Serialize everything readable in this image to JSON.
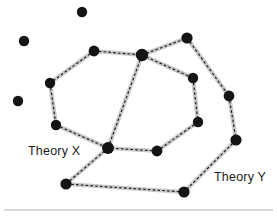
{
  "figure": {
    "background_color": "#ffffff",
    "width": 277,
    "height": 216
  },
  "labels": [
    {
      "id": "theory-x",
      "text": "Theory X",
      "x": 28,
      "y": 155,
      "anchor": "start"
    },
    {
      "id": "theory-y",
      "text": "Theory Y",
      "x": 214,
      "y": 181,
      "anchor": "start"
    }
  ],
  "style": {
    "node_color": "#141414",
    "node_radius": 5.0,
    "edge_halo_color": "#c9c9c9",
    "edge_dash_color": "#1a1a1a",
    "label_color": "#1c1c1c",
    "baseline_color": "#b5b5b5"
  },
  "baseline": {
    "x1": 4,
    "y1": 210,
    "x2": 273,
    "y2": 210
  },
  "graph_data": {
    "type": "node-link-diagram",
    "node_count": 17,
    "edge_count": 17,
    "isolated_node_count": 3,
    "nodes": [
      {
        "id": "iso1",
        "label": "",
        "x": 82,
        "y": 12,
        "r": 5.2,
        "group": "isolated"
      },
      {
        "id": "iso2",
        "label": "",
        "x": 24,
        "y": 41,
        "r": 5.2,
        "group": "isolated"
      },
      {
        "id": "iso3",
        "label": "",
        "x": 18,
        "y": 101,
        "r": 5.2,
        "group": "isolated"
      },
      {
        "id": "n1",
        "label": "",
        "x": 94,
        "y": 51,
        "r": 5.4,
        "group": "theory-x"
      },
      {
        "id": "n2",
        "label": "",
        "x": 50,
        "y": 83,
        "r": 5.2,
        "group": "theory-x"
      },
      {
        "id": "n3",
        "label": "",
        "x": 56,
        "y": 125,
        "r": 5.2,
        "group": "theory-x"
      },
      {
        "id": "n4",
        "label": "",
        "x": 108,
        "y": 148,
        "r": 6.0,
        "group": "shared-hub-lower"
      },
      {
        "id": "n5",
        "label": "",
        "x": 142,
        "y": 55,
        "r": 6.2,
        "group": "shared-hub-upper"
      },
      {
        "id": "n6",
        "label": "",
        "x": 187,
        "y": 38,
        "r": 5.6,
        "group": "theory-y"
      },
      {
        "id": "n7",
        "label": "",
        "x": 193,
        "y": 78,
        "r": 5.2,
        "group": "theory-y"
      },
      {
        "id": "n8",
        "label": "",
        "x": 198,
        "y": 122,
        "r": 5.2,
        "group": "theory-y"
      },
      {
        "id": "n9",
        "label": "",
        "x": 157,
        "y": 151,
        "r": 5.4,
        "group": "theory-y"
      },
      {
        "id": "n10",
        "label": "",
        "x": 229,
        "y": 96,
        "r": 5.4,
        "group": "theory-y"
      },
      {
        "id": "n11",
        "label": "",
        "x": 236,
        "y": 140,
        "r": 5.6,
        "group": "theory-y"
      },
      {
        "id": "n12",
        "label": "",
        "x": 184,
        "y": 192,
        "r": 5.6,
        "group": "theory-y"
      },
      {
        "id": "n13",
        "label": "",
        "x": 66,
        "y": 184,
        "r": 5.6,
        "group": "theory-y"
      },
      {
        "id": "n14",
        "label": "",
        "x": 142,
        "y": 55,
        "r": 0.0,
        "group": "anchor-dup"
      }
    ],
    "edges": [
      {
        "source": "n1",
        "target": "n5",
        "group": "theory-x"
      },
      {
        "source": "n1",
        "target": "n2",
        "group": "theory-x"
      },
      {
        "source": "n2",
        "target": "n3",
        "group": "theory-x"
      },
      {
        "source": "n3",
        "target": "n4",
        "group": "theory-x"
      },
      {
        "source": "n4",
        "target": "n5",
        "group": "theory-x"
      },
      {
        "source": "n5",
        "target": "n6",
        "group": "theory-y"
      },
      {
        "source": "n5",
        "target": "n7",
        "group": "theory-y"
      },
      {
        "source": "n7",
        "target": "n8",
        "group": "theory-y"
      },
      {
        "source": "n8",
        "target": "n9",
        "group": "theory-y"
      },
      {
        "source": "n9",
        "target": "n4",
        "group": "theory-y"
      },
      {
        "source": "n6",
        "target": "n10",
        "group": "theory-y"
      },
      {
        "source": "n10",
        "target": "n11",
        "group": "theory-y"
      },
      {
        "source": "n11",
        "target": "n12",
        "group": "theory-y"
      },
      {
        "source": "n12",
        "target": "n13",
        "group": "theory-y"
      },
      {
        "source": "n13",
        "target": "n4",
        "group": "theory-y"
      }
    ]
  }
}
